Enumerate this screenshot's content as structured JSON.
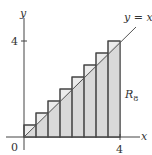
{
  "figure": {
    "type": "riemann-sum-diagram",
    "function_label": "y = x",
    "region_label": "R",
    "region_subscript": "8",
    "axes": {
      "x_label": "x",
      "y_label": "y",
      "origin_label": "0",
      "x_tick_label": "4",
      "y_tick_label": "4"
    },
    "colors": {
      "fill": "#d6d6d6",
      "stroke": "#444444",
      "background": "#ffffff"
    }
  },
  "chart_data": {
    "type": "bar",
    "title": "",
    "xlabel": "x",
    "ylabel": "y",
    "xlim": [
      0,
      4
    ],
    "ylim": [
      0,
      4
    ],
    "n": 8,
    "width": 0.5,
    "x": [
      0,
      0.5,
      1,
      1.5,
      2,
      2.5,
      3,
      3.5
    ],
    "values": [
      0.5,
      1,
      1.5,
      2,
      2.5,
      3,
      3.5,
      4
    ],
    "line": {
      "label": "y = x",
      "from": [
        0,
        0
      ],
      "to": [
        4.6,
        4.6
      ]
    },
    "annotations": [
      "R_8"
    ]
  }
}
